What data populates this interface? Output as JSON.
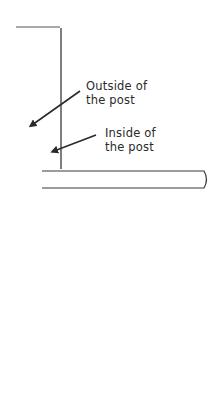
{
  "diagram": {
    "type": "post-and-rail illustration",
    "labels": [
      {
        "id": "outside",
        "line1": "Outside of",
        "line2": "the post"
      },
      {
        "id": "inside",
        "line1": "Inside of",
        "line2": "the post"
      }
    ],
    "colors": {
      "stroke": "#3a3a3a",
      "text": "#2a2a2a",
      "background": "#ffffff"
    }
  }
}
